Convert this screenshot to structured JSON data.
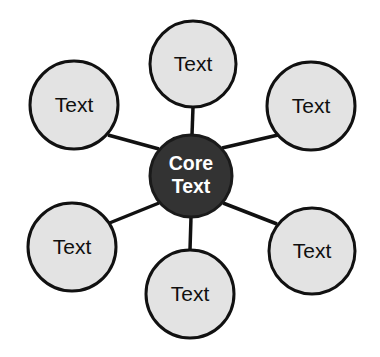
{
  "diagram": {
    "type": "hub-and-spoke",
    "canvas": {
      "width": 380,
      "height": 357,
      "background": "#ffffff"
    },
    "colors": {
      "background": "#ffffff",
      "core_fill": "#333333",
      "core_stroke": "#1a1a1a",
      "core_text": "#ffffff",
      "satellite_fill": "#e3e3e3",
      "satellite_stroke": "#111111",
      "satellite_text": "#101010",
      "connector": "#111111"
    },
    "core": {
      "id": "core",
      "label_line1": "Core",
      "label_line2": "Text",
      "cx": 191,
      "cy": 176,
      "r": 41,
      "stroke_width": 3
    },
    "satellites": [
      {
        "id": "satellite-top",
        "position": "top",
        "label": "Text",
        "cx": 193,
        "cy": 64,
        "r": 43,
        "stroke_width": 3
      },
      {
        "id": "satellite-top-right",
        "position": "top-right",
        "label": "Text",
        "cx": 311,
        "cy": 106,
        "r": 44,
        "stroke_width": 3
      },
      {
        "id": "satellite-bottom-right",
        "position": "bottom-right",
        "label": "Text",
        "cx": 312,
        "cy": 251,
        "r": 43,
        "stroke_width": 3
      },
      {
        "id": "satellite-bottom",
        "position": "bottom",
        "label": "Text",
        "cx": 190,
        "cy": 294,
        "r": 44,
        "stroke_width": 3
      },
      {
        "id": "satellite-bottom-left",
        "position": "bottom-left",
        "label": "Text",
        "cx": 72,
        "cy": 247,
        "r": 44,
        "stroke_width": 3
      },
      {
        "id": "satellite-top-left",
        "position": "top-left",
        "label": "Text",
        "cx": 74,
        "cy": 105,
        "r": 44,
        "stroke_width": 3
      }
    ],
    "connectors": [
      {
        "id": "connector-top",
        "from": "core",
        "to": "satellite-top",
        "x1": 192,
        "y1": 135,
        "x2": 193,
        "y2": 107,
        "width": 3.5
      },
      {
        "id": "connector-top-right",
        "from": "core",
        "to": "satellite-top-right",
        "x1": 222,
        "y1": 148,
        "x2": 278,
        "y2": 135,
        "width": 3.5
      },
      {
        "id": "connector-bottom-right",
        "from": "core",
        "to": "satellite-bottom-right",
        "x1": 223,
        "y1": 203,
        "x2": 277,
        "y2": 224,
        "width": 3.5
      },
      {
        "id": "connector-bottom",
        "from": "core",
        "to": "satellite-bottom",
        "x1": 191,
        "y1": 217,
        "x2": 190,
        "y2": 250,
        "width": 3.5
      },
      {
        "id": "connector-bottom-left",
        "from": "core",
        "to": "satellite-bottom-left",
        "x1": 159,
        "y1": 203,
        "x2": 107,
        "y2": 224,
        "width": 3.5
      },
      {
        "id": "connector-top-left",
        "from": "core",
        "to": "satellite-top-left",
        "x1": 159,
        "y1": 149,
        "x2": 108,
        "y2": 135,
        "width": 3.5
      }
    ]
  }
}
